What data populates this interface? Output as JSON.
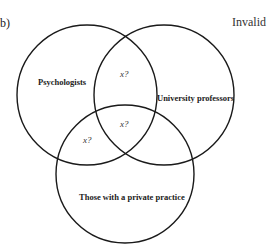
{
  "panel_label": "b)",
  "verdict": "Invalid",
  "colors": {
    "stroke": "#1a1a1a",
    "text": "#222222",
    "background": "#ffffff"
  },
  "sets": [
    {
      "label": "Psychologists",
      "cx": 87,
      "cy": 95,
      "r": 70
    },
    {
      "label": "University professors",
      "cx": 164,
      "cy": 95,
      "r": 70
    },
    {
      "label": "Those with a private practice",
      "cx": 125,
      "cy": 174,
      "r": 69
    }
  ],
  "region_marks": [
    {
      "label": "x?",
      "region": "Psychologists ∩ University professors only"
    },
    {
      "label": "x?",
      "region": "Psychologists ∩ University professors ∩ private practice"
    },
    {
      "label": "x?",
      "region": "Psychologists ∩ private practice only"
    }
  ]
}
